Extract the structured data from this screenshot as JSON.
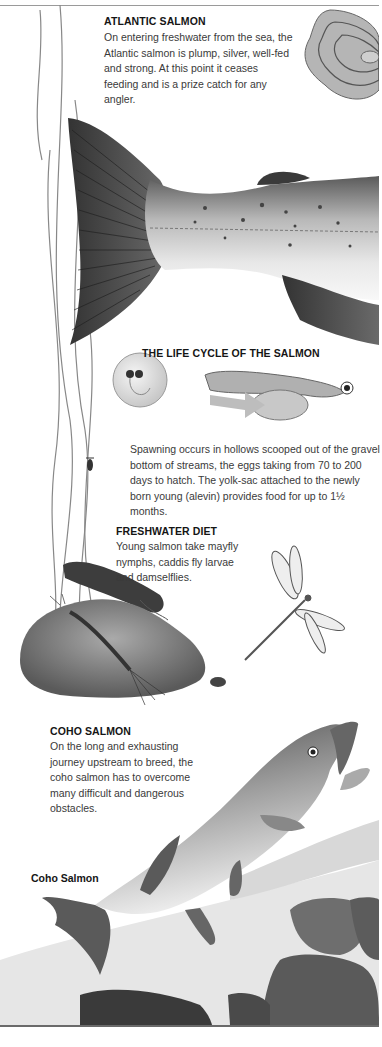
{
  "sections": {
    "atlantic": {
      "heading": "ATLANTIC SALMON",
      "body": "On entering freshwater from the sea, the Atlantic salmon is plump, silver, well-fed and strong. At this point it ceases feeding and is a prize catch for any angler."
    },
    "life_cycle": {
      "heading": "THE LIFE CYCLE OF THE SALMON",
      "body": "Spawning occurs in hollows scooped out of the gravel bottom of streams, the eggs taking from 70 to 200 days to hatch. The yolk-sac attached to the newly born young (alevin) provides food for up to 1½ months."
    },
    "diet": {
      "heading": "FRESHWATER DIET",
      "body": "Young salmon take mayfly nymphs, caddis fly larvae and damselflies."
    },
    "coho": {
      "heading": "COHO SALMON",
      "body": "On the long and exhausting journey upstream to breed, the coho salmon has to overcome many difficult and dangerous obstacles."
    }
  },
  "captions": {
    "coho_label": "Coho Salmon"
  },
  "illustrations": [
    "salmon-scale",
    "atlantic-salmon-tail",
    "salmon-egg",
    "alevin",
    "water-weed",
    "caddis-larva",
    "stone",
    "mayfly-nymph",
    "damselfly",
    "coho-salmon",
    "rocks",
    "water-splash"
  ]
}
